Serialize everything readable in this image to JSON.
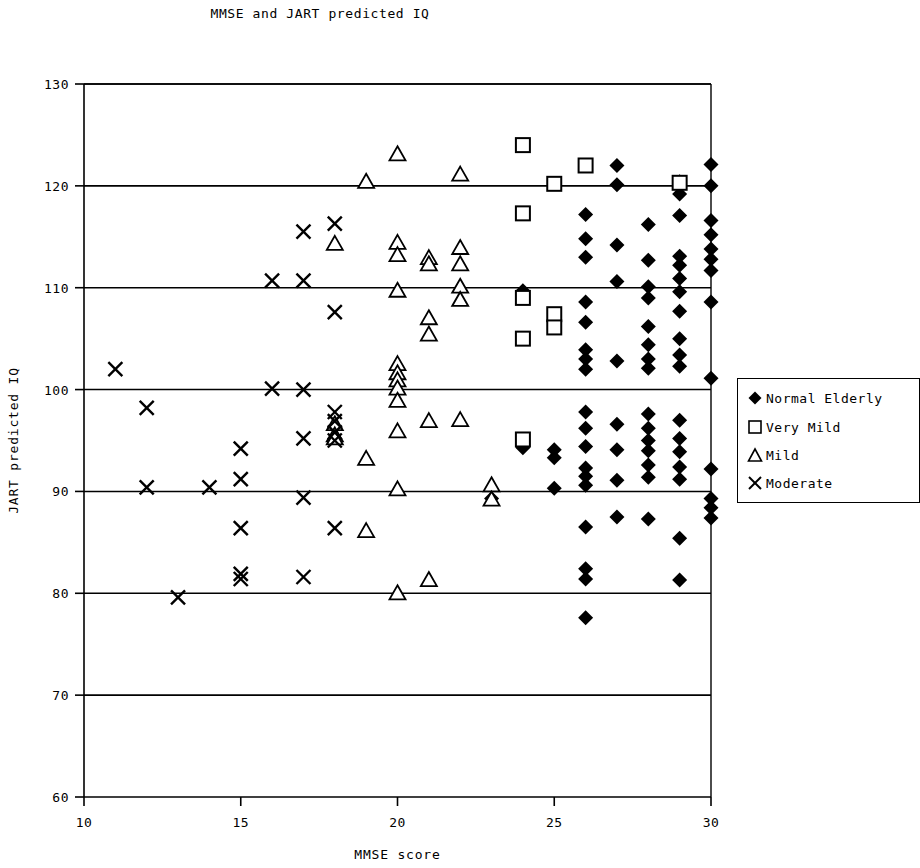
{
  "chart_data": {
    "type": "scatter",
    "title": "MMSE and JART predicted IQ",
    "xlabel": "MMSE score",
    "ylabel": "JART predicted IQ",
    "xlim": [
      10,
      30
    ],
    "ylim": [
      60,
      130
    ],
    "xticks": [
      10,
      15,
      20,
      25,
      30
    ],
    "yticks": [
      60,
      70,
      80,
      90,
      100,
      110,
      120,
      130
    ],
    "grid": "horizontal-major",
    "legend_position": "right",
    "series": [
      {
        "name": "Normal Elderly",
        "marker": "filled-diamond",
        "color": "#000000",
        "points": [
          [
            25,
            93.3
          ],
          [
            25,
            94.1
          ],
          [
            25,
            90.3
          ],
          [
            24,
            109.7
          ],
          [
            24,
            94.3
          ],
          [
            23,
            89.3
          ],
          [
            26,
            117.2
          ],
          [
            26,
            114.8
          ],
          [
            26,
            113.0
          ],
          [
            26,
            108.6
          ],
          [
            26,
            106.6
          ],
          [
            26,
            103.9
          ],
          [
            26,
            103.0
          ],
          [
            26,
            102.0
          ],
          [
            26,
            97.8
          ],
          [
            26,
            96.2
          ],
          [
            26,
            94.4
          ],
          [
            26,
            92.3
          ],
          [
            26,
            91.5
          ],
          [
            26,
            90.6
          ],
          [
            26,
            86.5
          ],
          [
            26,
            82.4
          ],
          [
            26,
            81.4
          ],
          [
            26,
            77.6
          ],
          [
            27,
            122.0
          ],
          [
            27,
            120.1
          ],
          [
            27,
            114.2
          ],
          [
            27,
            110.6
          ],
          [
            27,
            102.8
          ],
          [
            27,
            96.6
          ],
          [
            27,
            94.1
          ],
          [
            27,
            91.1
          ],
          [
            27,
            87.5
          ],
          [
            28,
            116.2
          ],
          [
            28,
            112.7
          ],
          [
            28,
            110.1
          ],
          [
            28,
            109.0
          ],
          [
            28,
            106.2
          ],
          [
            28,
            104.4
          ],
          [
            28,
            103.0
          ],
          [
            28,
            102.1
          ],
          [
            28,
            97.6
          ],
          [
            28,
            96.2
          ],
          [
            28,
            95.0
          ],
          [
            28,
            94.0
          ],
          [
            28,
            92.6
          ],
          [
            28,
            91.4
          ],
          [
            28,
            87.3
          ],
          [
            29,
            120.4
          ],
          [
            29,
            119.2
          ],
          [
            29,
            117.1
          ],
          [
            29,
            113.1
          ],
          [
            29,
            112.2
          ],
          [
            29,
            110.9
          ],
          [
            29,
            109.6
          ],
          [
            29,
            107.7
          ],
          [
            29,
            105.0
          ],
          [
            29,
            103.4
          ],
          [
            29,
            102.3
          ],
          [
            29,
            97.0
          ],
          [
            29,
            95.2
          ],
          [
            29,
            93.9
          ],
          [
            29,
            92.4
          ],
          [
            29,
            91.2
          ],
          [
            29,
            85.4
          ],
          [
            29,
            81.3
          ],
          [
            30,
            122.1
          ],
          [
            30,
            120.0
          ],
          [
            30,
            116.6
          ],
          [
            30,
            115.2
          ],
          [
            30,
            113.8
          ],
          [
            30,
            112.8
          ],
          [
            30,
            111.7
          ],
          [
            30,
            108.6
          ],
          [
            30,
            101.1
          ],
          [
            30,
            92.2
          ],
          [
            30,
            89.3
          ],
          [
            30,
            88.4
          ],
          [
            30,
            87.4
          ]
        ]
      },
      {
        "name": "Very Mild",
        "marker": "open-square",
        "color": "#000000",
        "points": [
          [
            24,
            124.0
          ],
          [
            24,
            117.3
          ],
          [
            24,
            109.0
          ],
          [
            24,
            105.0
          ],
          [
            24,
            95.1
          ],
          [
            25,
            120.2
          ],
          [
            25,
            107.4
          ],
          [
            25,
            106.1
          ],
          [
            26,
            122.0
          ],
          [
            29,
            120.3
          ]
        ]
      },
      {
        "name": "Mild",
        "marker": "open-triangle",
        "color": "#000000",
        "points": [
          [
            19,
            120.4
          ],
          [
            20,
            123.1
          ],
          [
            20,
            114.4
          ],
          [
            20,
            113.2
          ],
          [
            20,
            109.7
          ],
          [
            20,
            102.5
          ],
          [
            20,
            101.6
          ],
          [
            20,
            100.9
          ],
          [
            20,
            100.1
          ],
          [
            20,
            98.9
          ],
          [
            20,
            95.9
          ],
          [
            20,
            90.2
          ],
          [
            20,
            80.0
          ],
          [
            21,
            112.9
          ],
          [
            21,
            112.3
          ],
          [
            21,
            107.0
          ],
          [
            21,
            105.4
          ],
          [
            21,
            96.9
          ],
          [
            21,
            81.3
          ],
          [
            22,
            121.1
          ],
          [
            22,
            113.9
          ],
          [
            22,
            112.3
          ],
          [
            22,
            110.1
          ],
          [
            22,
            108.8
          ],
          [
            22,
            97.0
          ],
          [
            23,
            90.6
          ],
          [
            23,
            89.2
          ],
          [
            18,
            114.3
          ],
          [
            18,
            96.6
          ],
          [
            18,
            95.5
          ],
          [
            18,
            95.2
          ],
          [
            19,
            93.2
          ],
          [
            19,
            86.1
          ]
        ]
      },
      {
        "name": "Moderate",
        "marker": "cross",
        "color": "#000000",
        "points": [
          [
            11,
            102.0
          ],
          [
            12,
            98.2
          ],
          [
            12,
            90.4
          ],
          [
            13,
            79.6
          ],
          [
            14,
            90.4
          ],
          [
            15,
            91.2
          ],
          [
            15,
            94.2
          ],
          [
            15,
            86.4
          ],
          [
            15,
            81.9
          ],
          [
            15,
            81.4
          ],
          [
            16,
            110.7
          ],
          [
            16,
            100.1
          ],
          [
            17,
            115.5
          ],
          [
            17,
            110.7
          ],
          [
            17,
            100.0
          ],
          [
            17,
            95.2
          ],
          [
            17,
            89.4
          ],
          [
            17,
            81.6
          ],
          [
            18,
            116.3
          ],
          [
            18,
            107.6
          ],
          [
            18,
            97.8
          ],
          [
            18,
            96.9
          ],
          [
            18,
            95.8
          ],
          [
            18,
            95.0
          ],
          [
            18,
            86.4
          ]
        ]
      }
    ]
  },
  "legend": {
    "items": [
      {
        "label": "Normal Elderly",
        "marker": "filled-diamond"
      },
      {
        "label": "Very Mild",
        "marker": "open-square"
      },
      {
        "label": "Mild",
        "marker": "open-triangle"
      },
      {
        "label": "Moderate",
        "marker": "cross"
      }
    ]
  },
  "colors": {
    "ink": "#000000",
    "background": "#ffffff"
  }
}
